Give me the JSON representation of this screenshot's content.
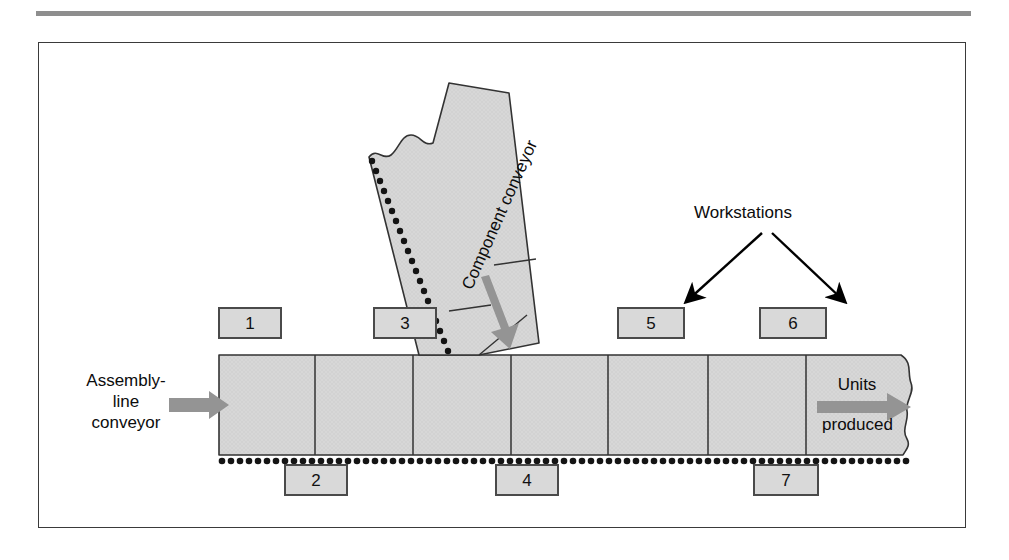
{
  "figure": {
    "frame_border_color": "#3a3a3a",
    "rule_color": "#8e8e8e",
    "belt_fill": "#d5d5d5",
    "box_fill": "#d9d9d9",
    "box_border": "#4a4a4a",
    "arrow_gray": "#8c8c8c",
    "arrow_black": "#000000"
  },
  "labels": {
    "assembly_line_conveyor": "Assembly-\nline\nconveyor",
    "component_conveyor": "Component conveyor",
    "workstations": "Workstations",
    "units": "Units",
    "produced": "produced"
  },
  "workstations": [
    {
      "id": "1",
      "label": "1",
      "position": "above-belt",
      "x": 217,
      "y": 308,
      "w": 64,
      "h": 32
    },
    {
      "id": "2",
      "label": "2",
      "position": "below-belt",
      "x": 283,
      "y": 465,
      "w": 64,
      "h": 32
    },
    {
      "id": "3",
      "label": "3",
      "position": "above-belt",
      "x": 372,
      "y": 308,
      "w": 64,
      "h": 32
    },
    {
      "id": "4",
      "label": "4",
      "position": "below-belt",
      "x": 494,
      "y": 465,
      "w": 64,
      "h": 32
    },
    {
      "id": "5",
      "label": "5",
      "position": "above-belt",
      "x": 616,
      "y": 308,
      "w": 68,
      "h": 32
    },
    {
      "id": "6",
      "label": "6",
      "position": "above-belt",
      "x": 758,
      "y": 308,
      "w": 68,
      "h": 32
    },
    {
      "id": "7",
      "label": "7",
      "position": "below-belt",
      "x": 752,
      "y": 465,
      "w": 66,
      "h": 32
    }
  ],
  "belt": {
    "name": "assembly-line-conveyor-belt",
    "left": 218,
    "top": 354,
    "right": 925,
    "bottom": 447,
    "segment_divider_x": [
      314,
      412,
      510,
      607,
      707,
      805
    ],
    "dotted_track_y": 452,
    "torn_right_edge": true
  },
  "component_conveyor": {
    "name": "component-conveyor",
    "angle_degrees": -66,
    "torn_top_edge": true,
    "dotted_track_side": "left",
    "flow_direction": "down-right",
    "rung_count": 2
  },
  "arrows": {
    "assembly_inflow": {
      "name": "assembly-inflow-arrow",
      "color": "#8c8c8c",
      "direction": "right"
    },
    "units_outflow": {
      "name": "units-produced-arrow",
      "color": "#8c8c8c",
      "direction": "right"
    },
    "component_flow": {
      "name": "component-flow-arrow",
      "color": "#8c8c8c",
      "direction": "down-right"
    },
    "workstation_left": {
      "name": "workstations-callout-arrow-left",
      "color": "#000000",
      "target": "5"
    },
    "workstation_right": {
      "name": "workstations-callout-arrow-right",
      "color": "#000000",
      "target": "6"
    }
  }
}
